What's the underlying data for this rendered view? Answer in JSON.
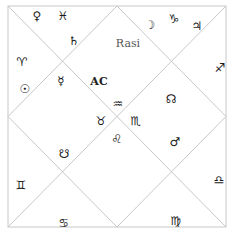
{
  "chart": {
    "title": "Rasi",
    "ascendant_label": "AC",
    "line_color": "#c8c8c8",
    "frame": {
      "x1": 8,
      "y1": 6,
      "x2": 226,
      "y2": 227
    }
  },
  "glyphs": [
    {
      "name": "venus-icon",
      "symbol": "♀",
      "x": 37,
      "y": 16
    },
    {
      "name": "pisces-icon",
      "symbol": "♓",
      "x": 63,
      "y": 16
    },
    {
      "name": "saturn-icon",
      "symbol": "♄",
      "x": 74,
      "y": 41
    },
    {
      "name": "moon-icon",
      "symbol": "☽",
      "x": 150,
      "y": 25
    },
    {
      "name": "capricorn-icon",
      "symbol": "♑",
      "x": 174,
      "y": 19
    },
    {
      "name": "jupiter-icon",
      "symbol": "♃",
      "x": 197,
      "y": 26
    },
    {
      "name": "aries-icon",
      "symbol": "♈",
      "x": 22,
      "y": 62
    },
    {
      "name": "sun-icon",
      "symbol": "☉",
      "x": 25,
      "y": 89
    },
    {
      "name": "mercury-icon",
      "symbol": "☿",
      "x": 61,
      "y": 81
    },
    {
      "name": "sagittarius-icon",
      "symbol": "♐",
      "x": 220,
      "y": 68
    },
    {
      "name": "aquarius-icon",
      "symbol": "♒",
      "x": 118,
      "y": 104
    },
    {
      "name": "taurus-icon",
      "symbol": "♉",
      "x": 101,
      "y": 121
    },
    {
      "name": "scorpio-icon",
      "symbol": "♏",
      "x": 136,
      "y": 121
    },
    {
      "name": "leo-icon",
      "symbol": "♌",
      "x": 117,
      "y": 139
    },
    {
      "name": "north-node-icon",
      "symbol": "☊",
      "x": 171,
      "y": 99
    },
    {
      "name": "mars-icon",
      "symbol": "♂",
      "x": 175,
      "y": 142
    },
    {
      "name": "south-node-icon",
      "symbol": "☋",
      "x": 64,
      "y": 154
    },
    {
      "name": "gemini-icon",
      "symbol": "♊",
      "x": 21,
      "y": 185
    },
    {
      "name": "libra-icon",
      "symbol": "♎",
      "x": 219,
      "y": 180
    },
    {
      "name": "cancer-icon",
      "symbol": "♋",
      "x": 64,
      "y": 223
    },
    {
      "name": "virgo-icon",
      "symbol": "♍",
      "x": 176,
      "y": 221
    }
  ]
}
